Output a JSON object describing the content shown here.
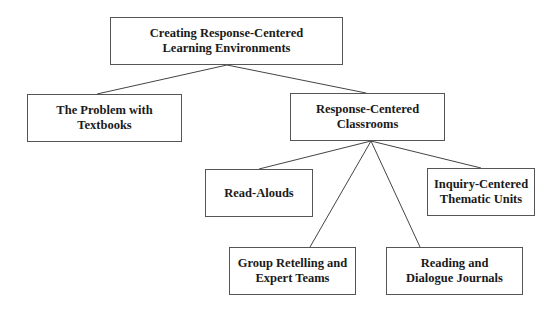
{
  "diagram": {
    "type": "hierarchy",
    "nodes": [
      {
        "id": "root",
        "label": "Creating Response-Centered\nLearning Environments",
        "box": [
          110,
          17,
          233,
          48
        ]
      },
      {
        "id": "problem",
        "label": "The Problem with\nTextbooks",
        "box": [
          27,
          94,
          155,
          48
        ]
      },
      {
        "id": "classrooms",
        "label": "Response-Centered\nClassrooms",
        "box": [
          290,
          93,
          155,
          48
        ]
      },
      {
        "id": "readalouds",
        "label": "Read-Alouds",
        "box": [
          205,
          169,
          108,
          48
        ]
      },
      {
        "id": "inquiry",
        "label": "Inquiry-Centered\nThematic Units",
        "box": [
          427,
          168,
          108,
          48
        ]
      },
      {
        "id": "group",
        "label": "Group Retelling and\nExpert Teams",
        "box": [
          229,
          247,
          127,
          48
        ]
      },
      {
        "id": "reading",
        "label": "Reading and\nDialogue Journals",
        "box": [
          386,
          247,
          137,
          48
        ]
      }
    ],
    "edges": [
      {
        "from": "root",
        "to": "problem",
        "line": [
          227,
          65,
          97,
          94
        ]
      },
      {
        "from": "root",
        "to": "classrooms",
        "line": [
          227,
          65,
          366,
          93
        ]
      },
      {
        "from": "classrooms",
        "to": "readalouds",
        "line": [
          371,
          141,
          259,
          169
        ]
      },
      {
        "from": "classrooms",
        "to": "inquiry",
        "line": [
          371,
          141,
          481,
          168
        ]
      },
      {
        "from": "classrooms",
        "to": "group",
        "line": [
          371,
          141,
          310,
          247
        ]
      },
      {
        "from": "classrooms",
        "to": "reading",
        "line": [
          371,
          141,
          420,
          247
        ]
      }
    ]
  }
}
